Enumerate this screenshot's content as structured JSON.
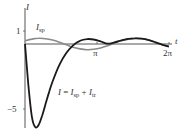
{
  "chart_data": {
    "type": "line",
    "title": "",
    "xlabel": "t",
    "ylabel": "I",
    "xlim": [
      0,
      6.4
    ],
    "ylim": [
      -6.5,
      1.2
    ],
    "grid": false,
    "legend": "inline labels",
    "x_ticks": [
      {
        "value": 3.14159,
        "label": "π"
      },
      {
        "value": 6.28318,
        "label": "2π"
      }
    ],
    "y_ticks": [
      {
        "value": 1,
        "label": "1"
      },
      {
        "value": -5,
        "label": "−5"
      }
    ],
    "series": [
      {
        "name": "I_sp",
        "label": "Isp",
        "color": "#8a8a8a",
        "description": "steady-periodic solution",
        "x": [
          0,
          0.3,
          0.6,
          0.9,
          1.2,
          1.5,
          1.8,
          2.1,
          2.4,
          2.7,
          3.0,
          3.3,
          3.6,
          3.9,
          4.2,
          4.5,
          4.8,
          5.1,
          5.4,
          5.7,
          6.0,
          6.28
        ],
        "values": [
          0.25,
          0.38,
          0.44,
          0.41,
          0.3,
          0.13,
          -0.06,
          -0.25,
          -0.38,
          -0.44,
          -0.41,
          -0.3,
          -0.13,
          0.06,
          0.25,
          0.38,
          0.44,
          0.41,
          0.3,
          0.13,
          -0.06,
          -0.2
        ]
      },
      {
        "name": "I",
        "label": "I = Isp + Itr",
        "color": "#1a1a1a",
        "description": "total current (steady-periodic plus transient)",
        "x": [
          0,
          0.15,
          0.3,
          0.45,
          0.6,
          0.75,
          0.9,
          1.05,
          1.2,
          1.5,
          1.8,
          2.1,
          2.4,
          2.7,
          3.0,
          3.3,
          3.6,
          3.9,
          4.2,
          4.5,
          4.8,
          5.1,
          5.4,
          5.7,
          6.0,
          6.28
        ],
        "values": [
          0,
          -3.2,
          -5.6,
          -6.4,
          -6.2,
          -5.5,
          -4.6,
          -3.7,
          -2.9,
          -1.6,
          -0.7,
          -0.1,
          0.25,
          0.38,
          0.35,
          0.2,
          0.02,
          0.12,
          0.28,
          0.39,
          0.44,
          0.41,
          0.3,
          0.13,
          -0.06,
          -0.2
        ]
      }
    ],
    "annotations": [
      {
        "text": "Isp",
        "target": "I_sp"
      },
      {
        "text": "I = Isp + Itr",
        "target": "I"
      }
    ]
  },
  "labels": {
    "y_axis": "I",
    "x_axis": "t",
    "tick_1": "1",
    "tick_neg5": "−5",
    "tick_pi": "π",
    "tick_2pi": "2π",
    "isp_main": "I",
    "isp_sub": "sp",
    "eq_I": "I",
    "eq_equals": " = ",
    "eq_Isp": "I",
    "eq_sp": "sp",
    "eq_plus": " + ",
    "eq_Itr": "I",
    "eq_tr": "tr"
  }
}
